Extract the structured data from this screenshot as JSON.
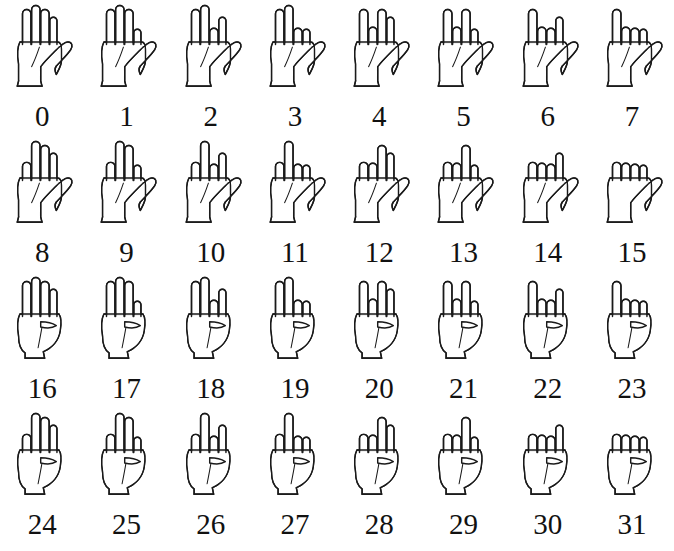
{
  "figure": {
    "type": "binary-finger-counting-chart",
    "title": "",
    "rows": 4,
    "columns": 8,
    "total_items": 32,
    "stroke_color": "#1a1a1a",
    "fill_color": "#ffffff",
    "label_color": "#111111",
    "background_color": "#ffffff",
    "finger_order": [
      "thumb",
      "index",
      "middle",
      "ring",
      "pinky"
    ],
    "bit_weights": [
      16,
      8,
      4,
      2,
      1
    ],
    "extended_means": 0,
    "closed_means": 1
  },
  "items": [
    {
      "label": "0",
      "value": 0,
      "bits": [
        0,
        0,
        0,
        0,
        0
      ]
    },
    {
      "label": "1",
      "value": 1,
      "bits": [
        0,
        0,
        0,
        0,
        1
      ]
    },
    {
      "label": "2",
      "value": 2,
      "bits": [
        0,
        0,
        0,
        1,
        0
      ]
    },
    {
      "label": "3",
      "value": 3,
      "bits": [
        0,
        0,
        0,
        1,
        1
      ]
    },
    {
      "label": "4",
      "value": 4,
      "bits": [
        0,
        0,
        1,
        0,
        0
      ]
    },
    {
      "label": "5",
      "value": 5,
      "bits": [
        0,
        0,
        1,
        0,
        1
      ]
    },
    {
      "label": "6",
      "value": 6,
      "bits": [
        0,
        0,
        1,
        1,
        0
      ]
    },
    {
      "label": "7",
      "value": 7,
      "bits": [
        0,
        0,
        1,
        1,
        1
      ]
    },
    {
      "label": "8",
      "value": 8,
      "bits": [
        0,
        1,
        0,
        0,
        0
      ]
    },
    {
      "label": "9",
      "value": 9,
      "bits": [
        0,
        1,
        0,
        0,
        1
      ]
    },
    {
      "label": "10",
      "value": 10,
      "bits": [
        0,
        1,
        0,
        1,
        0
      ]
    },
    {
      "label": "11",
      "value": 11,
      "bits": [
        0,
        1,
        0,
        1,
        1
      ]
    },
    {
      "label": "12",
      "value": 12,
      "bits": [
        0,
        1,
        1,
        0,
        0
      ]
    },
    {
      "label": "13",
      "value": 13,
      "bits": [
        0,
        1,
        1,
        0,
        1
      ]
    },
    {
      "label": "14",
      "value": 14,
      "bits": [
        0,
        1,
        1,
        1,
        0
      ]
    },
    {
      "label": "15",
      "value": 15,
      "bits": [
        0,
        1,
        1,
        1,
        1
      ]
    },
    {
      "label": "16",
      "value": 16,
      "bits": [
        1,
        0,
        0,
        0,
        0
      ]
    },
    {
      "label": "17",
      "value": 17,
      "bits": [
        1,
        0,
        0,
        0,
        1
      ]
    },
    {
      "label": "18",
      "value": 18,
      "bits": [
        1,
        0,
        0,
        1,
        0
      ]
    },
    {
      "label": "19",
      "value": 19,
      "bits": [
        1,
        0,
        0,
        1,
        1
      ]
    },
    {
      "label": "20",
      "value": 20,
      "bits": [
        1,
        0,
        1,
        0,
        0
      ]
    },
    {
      "label": "21",
      "value": 21,
      "bits": [
        1,
        0,
        1,
        0,
        1
      ]
    },
    {
      "label": "22",
      "value": 22,
      "bits": [
        1,
        0,
        1,
        1,
        0
      ]
    },
    {
      "label": "23",
      "value": 23,
      "bits": [
        1,
        0,
        1,
        1,
        1
      ]
    },
    {
      "label": "24",
      "value": 24,
      "bits": [
        1,
        1,
        0,
        0,
        0
      ]
    },
    {
      "label": "25",
      "value": 25,
      "bits": [
        1,
        1,
        0,
        0,
        1
      ]
    },
    {
      "label": "26",
      "value": 26,
      "bits": [
        1,
        1,
        0,
        1,
        0
      ]
    },
    {
      "label": "27",
      "value": 27,
      "bits": [
        1,
        1,
        0,
        1,
        1
      ]
    },
    {
      "label": "28",
      "value": 28,
      "bits": [
        1,
        1,
        1,
        0,
        0
      ]
    },
    {
      "label": "29",
      "value": 29,
      "bits": [
        1,
        1,
        1,
        0,
        1
      ]
    },
    {
      "label": "30",
      "value": 30,
      "bits": [
        1,
        1,
        1,
        1,
        0
      ]
    },
    {
      "label": "31",
      "value": 31,
      "bits": [
        1,
        1,
        1,
        1,
        1
      ]
    }
  ],
  "footer": {
    "caption": ""
  }
}
